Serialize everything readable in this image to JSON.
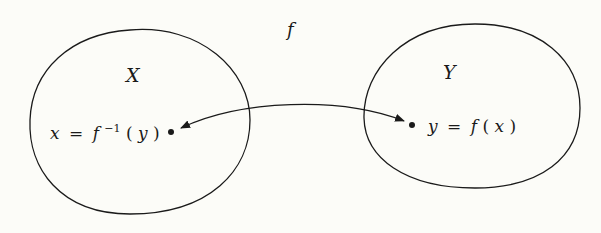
{
  "diagram": {
    "function_label": "f",
    "colors": {
      "background": "#fcfcf8",
      "stroke": "#1a1a1a"
    },
    "sets": [
      {
        "name": "X",
        "label": "X",
        "element_label": {
          "lhs": "x",
          "eq": "=",
          "fn": "f",
          "sup": "−1",
          "arg_open": "(",
          "arg": "y",
          "arg_close": ")"
        }
      },
      {
        "name": "Y",
        "label": "Y",
        "element_label": {
          "lhs": "y",
          "eq": "=",
          "fn": "f",
          "arg_open": "(",
          "arg": "x",
          "arg_close": ")"
        }
      }
    ],
    "arrow": {
      "type": "bidirectional",
      "from": "x",
      "to": "y"
    }
  }
}
